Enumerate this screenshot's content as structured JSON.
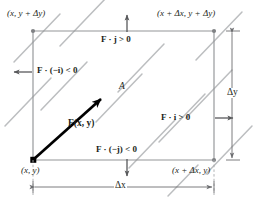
{
  "figure": {
    "name": "flux-through-rectangle-diagram",
    "colors": {
      "ink": "#231f20",
      "field_line": "#bcbec0",
      "edge": "#939598",
      "vector": "#000000",
      "background": "#ffffff"
    }
  },
  "corners": {
    "top_left": "(x, y + Δy)",
    "top_right": "(x + Δx, y + Δy)",
    "bottom_left": "(x, y)",
    "bottom_right": "(x + Δx, y)"
  },
  "flux_labels": {
    "top": "F · j > 0",
    "left": "F · (−i) < 0",
    "right": "F · i > 0",
    "bottom": "F · (−j) < 0"
  },
  "dimensions": {
    "width_label": "Δx",
    "height_label": "Δy"
  },
  "region_label": "A",
  "vector_label": "F(x, y)",
  "arrows": {
    "top": "up-arrow",
    "left": "left-arrow",
    "right": "right-arrow",
    "bottom": "down-arrow",
    "vector": "field-vector-arrow"
  }
}
